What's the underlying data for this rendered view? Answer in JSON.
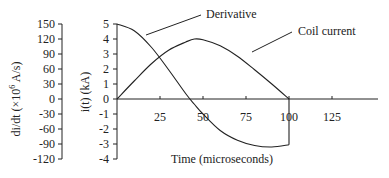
{
  "chart_data": {
    "type": "line",
    "title": "",
    "xlabel": "Time (microseconds)",
    "ylabel_left": "di/dt (×10^6 A/s)",
    "ylabel_right": "i(t) (kA)",
    "xlim": [
      0,
      150
    ],
    "ylim_current": [
      -4,
      5
    ],
    "ylim_derivative": [
      -120,
      150
    ],
    "x_ticks": [
      25,
      50,
      75,
      100,
      125
    ],
    "y_ticks_current": [
      5,
      4,
      3,
      2,
      1,
      0,
      -1,
      -2,
      -3,
      -4
    ],
    "y_ticks_derivative": [
      150,
      120,
      90,
      60,
      30,
      0,
      -30,
      -60,
      -90,
      -120
    ],
    "grid": false,
    "annotations": [
      "Derivative",
      "Coil current"
    ],
    "series": [
      {
        "name": "Coil current",
        "unit": "kA",
        "x": [
          0,
          10,
          20,
          30,
          40,
          45,
          50,
          60,
          70,
          80,
          90,
          100
        ],
        "values": [
          0,
          1.2,
          2.35,
          3.25,
          3.8,
          4.0,
          3.95,
          3.55,
          2.85,
          1.95,
          1.0,
          0
        ]
      },
      {
        "name": "Derivative",
        "unit": "x10^6 A/s (plotted on kA scale)",
        "x": [
          0,
          10,
          20,
          30,
          40,
          45,
          50,
          60,
          70,
          80,
          90,
          100
        ],
        "values": [
          5.0,
          4.55,
          3.45,
          1.95,
          0.35,
          -0.35,
          -1.0,
          -2.1,
          -2.75,
          -3.1,
          -3.2,
          -3.05
        ]
      }
    ]
  },
  "labels": {
    "left_axis_label": "di/dt (×10",
    "left_axis_exp": "6",
    "left_axis_unit": " A/s)",
    "right_axis_label": "i(t) (kA)",
    "x_axis_label": "Time (microseconds)",
    "derivative_annotation": "Derivative",
    "current_annotation": "Coil current"
  }
}
